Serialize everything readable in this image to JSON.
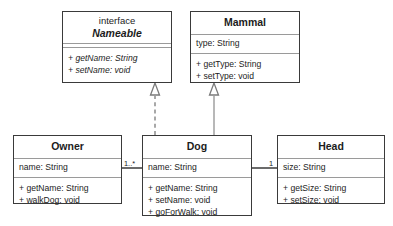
{
  "diagram": {
    "type": "uml-class-diagram",
    "classes": [
      {
        "id": "nameable",
        "stereotype": "interface",
        "name": "Nameable",
        "abstract": true,
        "attributes": [],
        "operations": [
          "+ getName: String",
          "+ setName: void"
        ]
      },
      {
        "id": "mammal",
        "stereotype": "",
        "name": "Mammal",
        "abstract": false,
        "attributes": [
          "type: String"
        ],
        "operations": [
          "+ getType: String",
          "+ setType: void"
        ]
      },
      {
        "id": "owner",
        "stereotype": "",
        "name": "Owner",
        "abstract": false,
        "attributes": [
          "name: String"
        ],
        "operations": [
          "+ getName: String",
          "+ walkDog: void"
        ]
      },
      {
        "id": "dog",
        "stereotype": "",
        "name": "Dog",
        "abstract": false,
        "attributes": [
          "name: String"
        ],
        "operations": [
          "+ getName: String",
          "+ setName: void",
          "+ goForWalk: void"
        ]
      },
      {
        "id": "head",
        "stereotype": "",
        "name": "Head",
        "abstract": false,
        "attributes": [
          "size: String"
        ],
        "operations": [
          "+ getSize: String",
          "+ setSize: void"
        ]
      }
    ],
    "relationships": [
      {
        "id": "dog-realizes-nameable",
        "kind": "realization",
        "from": "dog",
        "to": "nameable",
        "line": "dashed",
        "arrow": "hollow-triangle"
      },
      {
        "id": "dog-extends-mammal",
        "kind": "generalization",
        "from": "dog",
        "to": "mammal",
        "line": "solid",
        "arrow": "hollow-triangle"
      },
      {
        "id": "owner-dog-association",
        "kind": "association",
        "from": "owner",
        "to": "dog",
        "line": "solid",
        "arrow": "none",
        "source_multiplicity": "1..*",
        "target_multiplicity": ""
      },
      {
        "id": "dog-head-association",
        "kind": "association",
        "from": "dog",
        "to": "head",
        "line": "solid",
        "arrow": "none",
        "source_multiplicity": "",
        "target_multiplicity": "1"
      }
    ],
    "multiplicity_labels": [
      {
        "id": "owner-dog-mult",
        "text": "1..*"
      },
      {
        "id": "dog-head-mult",
        "text": "1"
      }
    ],
    "colors": {
      "border": "#3a3a3a",
      "divider": "#9a9a9a",
      "connector": "#6f6f6f",
      "background": "#ffffff",
      "text": "#1c1c1c"
    }
  }
}
